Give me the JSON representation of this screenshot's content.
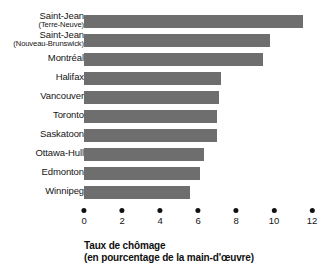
{
  "chart_data": {
    "type": "bar",
    "orientation": "horizontal",
    "title": "",
    "xlabel": "Taux de chômage (en pourcentage de la main-d'œuvre)",
    "ylabel": "",
    "xlim": [
      0,
      12
    ],
    "xticks": [
      0,
      2,
      4,
      6,
      8,
      10,
      12
    ],
    "xtick_labels": [
      "0",
      "2",
      "4",
      "6",
      "8",
      "10",
      "12"
    ],
    "grid": false,
    "legend": false,
    "bar_color": "#6e6e6e",
    "categories": [
      "Saint-Jean (Terre-Neuve)",
      "Saint-Jean (Nouveau-Brunswick)",
      "Montréal",
      "Halifax",
      "Vancouver",
      "Toronto",
      "Saskatoon",
      "Ottawa-Hull",
      "Edmonton",
      "Winnipeg"
    ],
    "values": [
      11.5,
      9.8,
      9.4,
      7.2,
      7.1,
      7.0,
      7.0,
      6.3,
      6.1,
      5.6
    ]
  },
  "caption": {
    "line1": "Taux de chômage",
    "line2": "(en pourcentage de la main-d'œuvre)"
  },
  "rows": [
    {
      "label_line1": "Saint-Jean",
      "label_line2": "(Terre-Neuve)",
      "value": 11.5
    },
    {
      "label_line1": "Saint-Jean",
      "label_line2": "(Nouveau-Brunswick)",
      "value": 9.8
    },
    {
      "label_line1": "Montréal",
      "label_line2": "",
      "value": 9.4
    },
    {
      "label_line1": "Halifax",
      "label_line2": "",
      "value": 7.2
    },
    {
      "label_line1": "Vancouver",
      "label_line2": "",
      "value": 7.1
    },
    {
      "label_line1": "Toronto",
      "label_line2": "",
      "value": 7.0
    },
    {
      "label_line1": "Saskatoon",
      "label_line2": "",
      "value": 7.0
    },
    {
      "label_line1": "Ottawa-Hull",
      "label_line2": "",
      "value": 6.3
    },
    {
      "label_line1": "Edmonton",
      "label_line2": "",
      "value": 6.1
    },
    {
      "label_line1": "Winnipeg",
      "label_line2": "",
      "value": 5.6
    }
  ]
}
